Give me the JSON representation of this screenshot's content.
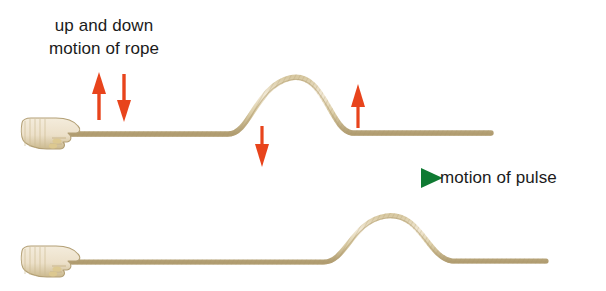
{
  "figure": {
    "background_color": "#ffffff"
  },
  "labels": {
    "up_and_down": {
      "line1": "up and down",
      "line2": "motion of rope",
      "color": "#1b1b1b"
    },
    "motion_of_pulse": {
      "text": "motion of pulse",
      "color": "#1b1b1b"
    }
  },
  "colors": {
    "rope_light": "#e8dcc0",
    "rope_mid": "#cfbf96",
    "rope_dark": "#a89468",
    "hand_fill": "#efe6d4",
    "hand_outline": "#b3a076",
    "red_arrow": "#e8441c",
    "green_arrow_start": "#1f9e86",
    "green_arrow_end": "#0f7a32",
    "text": "#1b1b1b"
  },
  "arrows": {
    "rope_motion_up": {
      "name": "up-arrow",
      "direction": "up",
      "color": "#e8441c"
    },
    "rope_motion_down": {
      "name": "down-arrow",
      "direction": "down",
      "color": "#e8441c"
    },
    "pulse_front_down": {
      "name": "down-arrow",
      "direction": "down",
      "color": "#e8441c"
    },
    "pulse_back_up": {
      "name": "up-arrow",
      "direction": "up",
      "color": "#e8441c"
    },
    "pulse_direction": {
      "name": "right-arrow",
      "direction": "right",
      "color": "#0f7a32"
    }
  },
  "diagram": {
    "top_rope": {
      "name": "rope-with-pulse-earlier",
      "baseline_y": 134,
      "pulse_peak_x": 290,
      "pulse_peak_y": 78,
      "pulse_start_x": 228,
      "pulse_end_x": 352,
      "left_end_x": 62,
      "right_end_x": 491
    },
    "bottom_rope": {
      "name": "rope-with-pulse-later",
      "baseline_y": 262,
      "pulse_peak_x": 386,
      "pulse_peak_y": 216,
      "pulse_start_x": 324,
      "pulse_end_x": 452,
      "left_end_x": 62,
      "right_end_x": 546
    },
    "top_hand": {
      "name": "hand-gripping-rope",
      "x": 20,
      "y": 118
    },
    "bottom_hand": {
      "name": "hand-gripping-rope",
      "x": 20,
      "y": 246
    }
  }
}
